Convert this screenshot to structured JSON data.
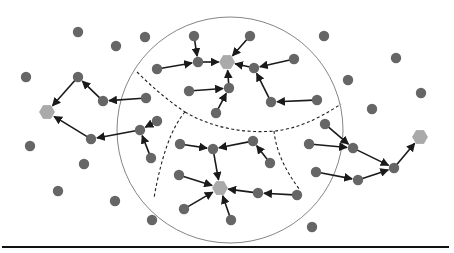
{
  "diagram": {
    "colors": {
      "node": "#666666",
      "sink": "#aaaaaa",
      "edge": "#1a1a1a",
      "boundary": "#777777",
      "divider": "#222222",
      "baseline": "#111111"
    },
    "nodes": [
      {
        "id": "i1",
        "type": "node",
        "x": 78,
        "y": 32
      },
      {
        "id": "i2",
        "type": "node",
        "x": 116,
        "y": 46
      },
      {
        "id": "i3",
        "type": "node",
        "x": 145,
        "y": 37
      },
      {
        "id": "i4",
        "type": "node",
        "x": 26,
        "y": 77
      },
      {
        "id": "i5",
        "type": "node",
        "x": 30,
        "y": 146
      },
      {
        "id": "i6",
        "type": "node",
        "x": 84,
        "y": 164
      },
      {
        "id": "i7",
        "type": "node",
        "x": 58,
        "y": 191
      },
      {
        "id": "i8",
        "type": "node",
        "x": 115,
        "y": 201
      },
      {
        "id": "i9",
        "type": "node",
        "x": 152,
        "y": 220
      },
      {
        "id": "i10",
        "type": "node",
        "x": 324,
        "y": 36
      },
      {
        "id": "i11",
        "type": "node",
        "x": 396,
        "y": 58
      },
      {
        "id": "i12",
        "type": "node",
        "x": 348,
        "y": 80
      },
      {
        "id": "i13",
        "type": "node",
        "x": 421,
        "y": 93
      },
      {
        "id": "i14",
        "type": "node",
        "x": 372,
        "y": 109
      },
      {
        "id": "i15",
        "type": "node",
        "x": 312,
        "y": 227
      },
      {
        "id": "L0",
        "type": "sink",
        "x": 47,
        "y": 112
      },
      {
        "id": "L1",
        "type": "node",
        "x": 78,
        "y": 77
      },
      {
        "id": "L2",
        "type": "node",
        "x": 103,
        "y": 101
      },
      {
        "id": "L3",
        "type": "node",
        "x": 146,
        "y": 98
      },
      {
        "id": "L4",
        "type": "node",
        "x": 91,
        "y": 139
      },
      {
        "id": "L5",
        "type": "node",
        "x": 140,
        "y": 130
      },
      {
        "id": "L6",
        "type": "node",
        "x": 157,
        "y": 121
      },
      {
        "id": "L7",
        "type": "node",
        "x": 151,
        "y": 158
      },
      {
        "id": "T0",
        "type": "sink",
        "x": 227,
        "y": 62
      },
      {
        "id": "T1",
        "type": "node",
        "x": 194,
        "y": 36
      },
      {
        "id": "T2",
        "type": "node",
        "x": 157,
        "y": 69
      },
      {
        "id": "T3",
        "type": "node",
        "x": 198,
        "y": 62
      },
      {
        "id": "T4",
        "type": "node",
        "x": 250,
        "y": 36
      },
      {
        "id": "T5",
        "type": "node",
        "x": 294,
        "y": 59
      },
      {
        "id": "T6",
        "type": "node",
        "x": 254,
        "y": 68
      },
      {
        "id": "T7",
        "type": "node",
        "x": 189,
        "y": 91
      },
      {
        "id": "T8",
        "type": "node",
        "x": 229,
        "y": 88
      },
      {
        "id": "T9",
        "type": "node",
        "x": 216,
        "y": 113
      },
      {
        "id": "T10",
        "type": "node",
        "x": 317,
        "y": 100
      },
      {
        "id": "T11",
        "type": "node",
        "x": 271,
        "y": 102
      },
      {
        "id": "B0",
        "type": "sink",
        "x": 220,
        "y": 188
      },
      {
        "id": "B1",
        "type": "node",
        "x": 180,
        "y": 144
      },
      {
        "id": "B2",
        "type": "node",
        "x": 253,
        "y": 141
      },
      {
        "id": "B3",
        "type": "node",
        "x": 270,
        "y": 163
      },
      {
        "id": "B4",
        "type": "node",
        "x": 213,
        "y": 149
      },
      {
        "id": "B5",
        "type": "node",
        "x": 179,
        "y": 175
      },
      {
        "id": "B6",
        "type": "node",
        "x": 184,
        "y": 209
      },
      {
        "id": "B7",
        "type": "node",
        "x": 231,
        "y": 220
      },
      {
        "id": "B8",
        "type": "node",
        "x": 297,
        "y": 195
      },
      {
        "id": "B9",
        "type": "node",
        "x": 258,
        "y": 193
      },
      {
        "id": "R0",
        "type": "sink",
        "x": 420,
        "y": 137
      },
      {
        "id": "R1",
        "type": "node",
        "x": 394,
        "y": 168
      },
      {
        "id": "R2",
        "type": "node",
        "x": 353,
        "y": 148
      },
      {
        "id": "R3",
        "type": "node",
        "x": 325,
        "y": 124
      },
      {
        "id": "R4",
        "type": "node",
        "x": 309,
        "y": 144
      },
      {
        "id": "R5",
        "type": "node",
        "x": 358,
        "y": 180
      },
      {
        "id": "R6",
        "type": "node",
        "x": 316,
        "y": 172
      }
    ],
    "edges": [
      {
        "from": "L1",
        "to": "L0"
      },
      {
        "from": "L2",
        "to": "L1"
      },
      {
        "from": "L3",
        "to": "L2"
      },
      {
        "from": "L4",
        "to": "L0"
      },
      {
        "from": "L5",
        "to": "L4"
      },
      {
        "from": "L6",
        "to": "L5"
      },
      {
        "from": "L7",
        "to": "L5"
      },
      {
        "from": "T1",
        "to": "T3"
      },
      {
        "from": "T2",
        "to": "T3"
      },
      {
        "from": "T3",
        "to": "T0"
      },
      {
        "from": "T4",
        "to": "T0"
      },
      {
        "from": "T5",
        "to": "T6"
      },
      {
        "from": "T6",
        "to": "T0"
      },
      {
        "from": "T7",
        "to": "T8"
      },
      {
        "from": "T8",
        "to": "T0"
      },
      {
        "from": "T9",
        "to": "T8"
      },
      {
        "from": "T10",
        "to": "T11"
      },
      {
        "from": "T11",
        "to": "T6"
      },
      {
        "from": "B1",
        "to": "B4"
      },
      {
        "from": "B2",
        "to": "B4"
      },
      {
        "from": "B3",
        "to": "B2"
      },
      {
        "from": "B4",
        "to": "B0"
      },
      {
        "from": "B5",
        "to": "B0"
      },
      {
        "from": "B6",
        "to": "B0"
      },
      {
        "from": "B7",
        "to": "B0"
      },
      {
        "from": "B8",
        "to": "B9"
      },
      {
        "from": "B9",
        "to": "B0"
      },
      {
        "from": "R1",
        "to": "R0"
      },
      {
        "from": "R2",
        "to": "R1"
      },
      {
        "from": "R3",
        "to": "R2"
      },
      {
        "from": "R4",
        "to": "R2"
      },
      {
        "from": "R5",
        "to": "R1"
      },
      {
        "from": "R6",
        "to": "R5"
      }
    ]
  }
}
